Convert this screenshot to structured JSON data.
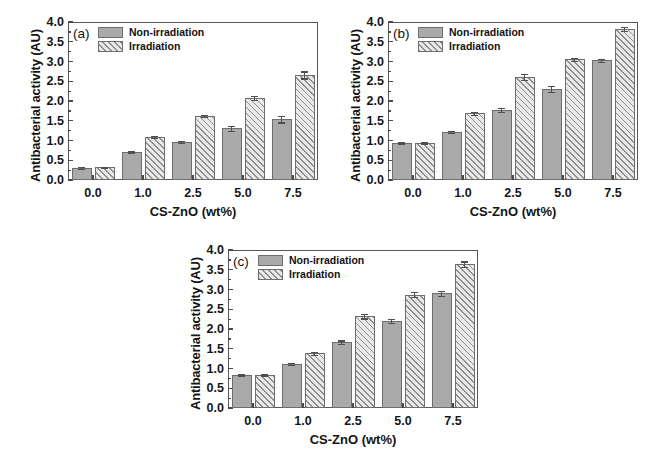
{
  "figure": {
    "width": 655,
    "height": 459,
    "background": "#ffffff",
    "series_colors": {
      "non_irradiation": "#aaaaaa",
      "irradiation_hatch": "#8e8e8e",
      "irradiation_fill": "#e9e9e9",
      "axis": "#585858"
    }
  },
  "chart_data": [
    {
      "type": "bar",
      "panel": "(a)",
      "title": "",
      "xlabel": "CS-ZnO (wt%)",
      "ylabel": "Antibacterial activity (AU)",
      "categories": [
        "0.0",
        "1.0",
        "2.5",
        "5.0",
        "7.5"
      ],
      "ylim": [
        0.0,
        4.0
      ],
      "yticks": [
        "0.0",
        "0.5",
        "1.0",
        "1.5",
        "2.0",
        "2.5",
        "3.0",
        "3.5",
        "4.0"
      ],
      "grid": false,
      "legend_position": "top-left",
      "series": [
        {
          "name": "Non-irradiation",
          "values": [
            0.31,
            0.72,
            0.97,
            1.31,
            1.54
          ],
          "errors": [
            0.02,
            0.02,
            0.03,
            0.06,
            0.08
          ]
        },
        {
          "name": "Irradiation",
          "values": [
            0.32,
            1.09,
            1.62,
            2.08,
            2.66
          ],
          "errors": [
            0.02,
            0.02,
            0.03,
            0.05,
            0.09
          ]
        }
      ]
    },
    {
      "type": "bar",
      "panel": "(b)",
      "title": "",
      "xlabel": "CS-ZnO (wt%)",
      "ylabel": "Antibacterial activity (AU)",
      "categories": [
        "0.0",
        "1.0",
        "2.5",
        "5.0",
        "7.5"
      ],
      "ylim": [
        0.0,
        4.0
      ],
      "yticks": [
        "0.0",
        "0.5",
        "1.0",
        "1.5",
        "2.0",
        "2.5",
        "3.0",
        "3.5",
        "4.0"
      ],
      "grid": false,
      "legend_position": "top-left",
      "series": [
        {
          "name": "Non-irradiation",
          "values": [
            0.93,
            1.22,
            1.77,
            2.31,
            3.03
          ],
          "errors": [
            0.02,
            0.03,
            0.05,
            0.07,
            0.04
          ]
        },
        {
          "name": "Irradiation",
          "values": [
            0.93,
            1.69,
            2.61,
            3.06,
            3.83
          ],
          "errors": [
            0.02,
            0.04,
            0.08,
            0.04,
            0.05
          ]
        }
      ]
    },
    {
      "type": "bar",
      "panel": "(c)",
      "title": "",
      "xlabel": "CS-ZnO (wt%)",
      "ylabel": "Antibacterial activity (AU)",
      "categories": [
        "0.0",
        "1.0",
        "2.5",
        "5.0",
        "7.5"
      ],
      "ylim": [
        0.0,
        4.0
      ],
      "yticks": [
        "0.0",
        "0.5",
        "1.0",
        "1.5",
        "2.0",
        "2.5",
        "3.0",
        "3.5",
        "4.0"
      ],
      "grid": false,
      "legend_position": "top-left",
      "series": [
        {
          "name": "Non-irradiation",
          "values": [
            0.83,
            1.12,
            1.67,
            2.2,
            2.9
          ],
          "errors": [
            0.02,
            0.02,
            0.04,
            0.05,
            0.07
          ]
        },
        {
          "name": "Irradiation",
          "values": [
            0.83,
            1.39,
            2.33,
            2.87,
            3.64
          ],
          "errors": [
            0.02,
            0.04,
            0.06,
            0.06,
            0.07
          ]
        }
      ]
    }
  ],
  "panels": [
    {
      "tag": "(a)",
      "legend": [
        {
          "label": "Non-irradiation",
          "style": "solid"
        },
        {
          "label": "Irradiation",
          "style": "hatch"
        }
      ]
    },
    {
      "tag": "(b)",
      "legend": [
        {
          "label": "Non-irradiation",
          "style": "solid"
        },
        {
          "label": "Irradiation",
          "style": "hatch"
        }
      ]
    },
    {
      "tag": "(c)",
      "legend": [
        {
          "label": "Non-irradiation",
          "style": "solid"
        },
        {
          "label": "Irradiation",
          "style": "hatch"
        }
      ]
    }
  ]
}
